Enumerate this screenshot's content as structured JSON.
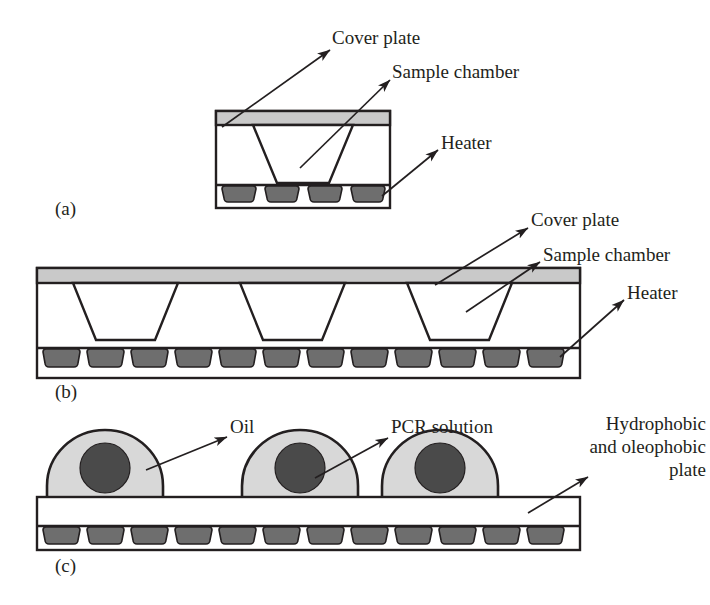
{
  "figure": {
    "type": "schematic-diagram",
    "panels": [
      {
        "id": "a",
        "letter": "(a)"
      },
      {
        "id": "b",
        "letter": "(b)"
      },
      {
        "id": "c",
        "letter": "(c)"
      }
    ]
  },
  "colors": {
    "line": "#231f20",
    "cover_plate_fill": "#c9c9c9",
    "heater_fill": "#6e6e6e",
    "body_fill": "#ffffff",
    "oil_fill": "#d8d8d8",
    "pcr_fill": "#4a4a4a",
    "background": "#ffffff"
  },
  "labels": {
    "panel_a": {
      "cover_plate": "Cover plate",
      "sample_chamber": "Sample chamber",
      "heater": "Heater"
    },
    "panel_b": {
      "cover_plate": "Cover plate",
      "sample_chamber": "Sample chamber",
      "heater": "Heater"
    },
    "panel_c": {
      "oil": "Oil",
      "pcr_solution": "PCR solution",
      "plate_line1": "Hydrophobic",
      "plate_line2": "and oleophobic",
      "plate_line3": "plate"
    }
  },
  "geometry": {
    "panel_a": {
      "box": {
        "x": 216,
        "y": 111,
        "w": 174,
        "h": 97
      },
      "cover_plate_height": 14,
      "chamber_count": 1,
      "heater_segment_count": 4,
      "heater_strip": {
        "y": 185,
        "h": 23
      }
    },
    "panel_b": {
      "box": {
        "x": 37,
        "y": 268,
        "w": 543,
        "h": 110
      },
      "cover_plate_height": 15,
      "chamber_count": 3,
      "heater_segment_count": 12,
      "heater_strip": {
        "y": 348,
        "h": 30
      }
    },
    "panel_c": {
      "plate": {
        "x": 37,
        "y": 497,
        "w": 543,
        "h": 53
      },
      "droplet_count": 3,
      "heater_segment_count": 12,
      "droplet_centers_x": [
        105,
        300,
        440
      ]
    }
  }
}
